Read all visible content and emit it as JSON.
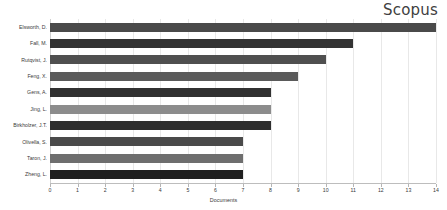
{
  "chart": {
    "title": "Scopus"
  },
  "chart_data": {
    "type": "bar",
    "orientation": "horizontal",
    "title": "Scopus",
    "xlabel": "Documents",
    "ylabel": "",
    "xlim": [
      0,
      14
    ],
    "xticks": [
      0,
      1,
      2,
      3,
      4,
      5,
      6,
      7,
      8,
      9,
      10,
      11,
      12,
      13,
      14
    ],
    "grid": true,
    "legend": "none",
    "categories": [
      "Elsworth, D.",
      "Fall, M.",
      "Rutqvist, J.",
      "Feng, X.",
      "Gens, A.",
      "Jing, L.",
      "Birkholzer, J.T.",
      "Olivella, S.",
      "Taron, J.",
      "Zheng, L."
    ],
    "values": [
      14,
      11,
      10,
      9,
      8,
      8,
      8,
      7,
      7,
      7
    ],
    "bar_colors": [
      "#4a4a4a",
      "#333333",
      "#4f4f4f",
      "#5a5a5a",
      "#313131",
      "#8c8c8c",
      "#2e2e2e",
      "#4a4a4a",
      "#6e6e6e",
      "#1f1f1f"
    ]
  }
}
